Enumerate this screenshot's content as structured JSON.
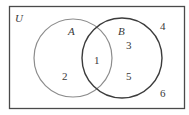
{
  "diagram": {
    "type": "venn",
    "universe": {
      "label": "U",
      "elements_outside": [
        "4",
        "6"
      ]
    },
    "sets": [
      {
        "label": "A",
        "stroke": "#8c8c8c",
        "elements_only": [
          "2"
        ]
      },
      {
        "label": "B",
        "stroke": "#3c3c3c",
        "elements_only": [
          "3",
          "5"
        ]
      }
    ],
    "intersection": {
      "elements": [
        "1"
      ]
    },
    "labels": {
      "universe": "U",
      "set_a": "A",
      "set_b": "B",
      "n1": "1",
      "n2": "2",
      "n3": "3",
      "n4": "4",
      "n5": "5",
      "n6": "6"
    }
  }
}
